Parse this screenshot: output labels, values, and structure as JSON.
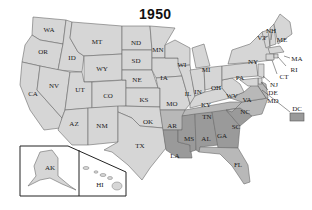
{
  "title": "1950",
  "colors": {
    "light": "#d6d6d6",
    "medium": "#b8b8b8",
    "dark": "#9a9a9a",
    "outline": "#6a6a6a",
    "inset_border": "#222222"
  },
  "legend_box": {
    "label": "DC",
    "shade": "dark"
  },
  "states": {
    "WA": "WA",
    "OR": "OR",
    "CA": "CA",
    "ID": "ID",
    "NV": "NV",
    "MT": "MT",
    "WY": "WY",
    "UT": "UT",
    "AZ": "AZ",
    "CO": "CO",
    "NM": "NM",
    "ND": "ND",
    "SD": "SD",
    "NE": "NE",
    "KS": "KS",
    "OK": "OK",
    "TX": "TX",
    "MN": "MN",
    "IA": "IA",
    "MO": "MO",
    "AR": "AR",
    "LA": "LA",
    "WI": "WI",
    "IL": "IL",
    "MI": "MI",
    "IN": "IN",
    "OH": "OH",
    "KY": "KY",
    "TN": "TN",
    "MS": "MS",
    "AL": "AL",
    "GA": "GA",
    "FL": "FL",
    "SC": "SC",
    "NC": "NC",
    "VA": "VA",
    "WV": "WV",
    "PA": "PA",
    "NY": "NY",
    "VT": "VT",
    "NH": "NH",
    "ME": "ME",
    "MA": "MA",
    "RI": "RI",
    "CT": "CT",
    "NJ": "NJ",
    "DE": "DE",
    "MD": "MD",
    "DC": "DC",
    "AK": "AK",
    "HI": "HI"
  },
  "shading": {
    "dark": [
      "LA",
      "MS",
      "AL",
      "GA",
      "SC",
      "DC"
    ],
    "medium": [
      "AR",
      "TN",
      "NC",
      "VA",
      "FL"
    ],
    "light": [
      "all other states"
    ]
  }
}
